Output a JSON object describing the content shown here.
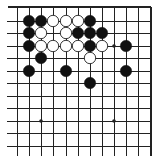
{
  "board": {
    "description": "Go board diagram, top-right corner view",
    "colors": {
      "background": "#ffffff",
      "line": "#222222",
      "black_stone": "#111111",
      "white_stone": "#ffffff",
      "white_stone_outline": "#222222"
    },
    "grid": {
      "x": [
        17,
        29,
        41,
        53,
        66,
        78,
        90,
        102,
        114,
        126,
        138,
        151
      ],
      "y": [
        7,
        21,
        33,
        46,
        58,
        71,
        83,
        96,
        108,
        121,
        133,
        146
      ],
      "left_stub_x": 7,
      "bottom_stub_y": 156,
      "top_edge": true,
      "right_edge": true
    },
    "star_points": [
      {
        "col": 8,
        "row": 3
      },
      {
        "col": 2,
        "row": 9
      },
      {
        "col": 8,
        "row": 9
      }
    ],
    "stones": [
      {
        "color": "black",
        "col": 1,
        "row": 1
      },
      {
        "color": "black",
        "col": 2,
        "row": 1
      },
      {
        "color": "white",
        "col": 3,
        "row": 1
      },
      {
        "color": "white",
        "col": 4,
        "row": 1
      },
      {
        "color": "white",
        "col": 5,
        "row": 1
      },
      {
        "color": "black",
        "col": 6,
        "row": 1
      },
      {
        "color": "black",
        "col": 1,
        "row": 2
      },
      {
        "color": "white",
        "col": 2,
        "row": 2
      },
      {
        "color": "white",
        "col": 4,
        "row": 2
      },
      {
        "color": "black",
        "col": 5,
        "row": 2
      },
      {
        "color": "black",
        "col": 6,
        "row": 2
      },
      {
        "color": "black",
        "col": 7,
        "row": 2
      },
      {
        "color": "black",
        "col": 1,
        "row": 3
      },
      {
        "color": "white",
        "col": 2,
        "row": 3
      },
      {
        "color": "white",
        "col": 3,
        "row": 3
      },
      {
        "color": "white",
        "col": 4,
        "row": 3
      },
      {
        "color": "white",
        "col": 5,
        "row": 3
      },
      {
        "color": "black",
        "col": 6,
        "row": 3
      },
      {
        "color": "white",
        "col": 7,
        "row": 3
      },
      {
        "color": "black",
        "col": 9,
        "row": 3
      },
      {
        "color": "black",
        "col": 2,
        "row": 4
      },
      {
        "color": "white",
        "col": 6,
        "row": 4
      },
      {
        "color": "black",
        "col": 1,
        "row": 5
      },
      {
        "color": "black",
        "col": 4,
        "row": 5
      },
      {
        "color": "black",
        "col": 9,
        "row": 5
      },
      {
        "color": "black",
        "col": 6,
        "row": 6
      }
    ]
  }
}
